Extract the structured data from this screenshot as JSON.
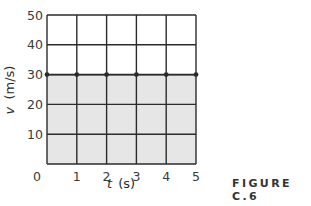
{
  "figure": {
    "caption": "FIGURE C.6"
  },
  "chart_data": {
    "type": "line",
    "title": "",
    "xlabel": "t (s)",
    "ylabel": "v (m/s)",
    "xlabel_var": "t",
    "xlabel_unit": "(s)",
    "ylabel_var": "v",
    "ylabel_unit": "(m/s)",
    "x": [
      0,
      1,
      2,
      3,
      4,
      5
    ],
    "series": [
      {
        "name": "velocity",
        "values": [
          30,
          30,
          30,
          30,
          30,
          30
        ],
        "markers": true
      }
    ],
    "shaded_area": {
      "from_y": 0,
      "to_y": 30,
      "x_range": [
        0,
        5
      ],
      "color": "#e6e6e6"
    },
    "xlim": [
      0,
      5
    ],
    "ylim": [
      0,
      50
    ],
    "xticks": [
      "0",
      "1",
      "2",
      "3",
      "4",
      "5"
    ],
    "yticks": [
      "10",
      "20",
      "30",
      "40",
      "50"
    ],
    "grid": true,
    "legend": null,
    "colors": {
      "grid": "#2b2b2b",
      "line": "#2b2b2b",
      "shade": "#e6e6e6"
    }
  }
}
